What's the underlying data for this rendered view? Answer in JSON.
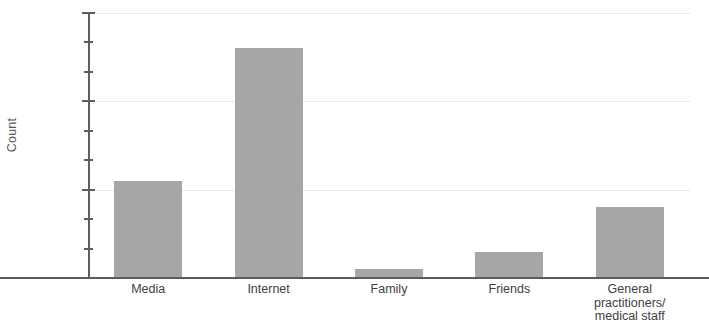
{
  "chart_data": {
    "type": "bar",
    "title": "",
    "subtitle": "",
    "xlabel": "",
    "ylabel": "Count",
    "categories": [
      "Media",
      "Internet",
      "Family",
      "Friends",
      "General practitioners/ medical staff"
    ],
    "category_lines": [
      [
        "Media"
      ],
      [
        "Internet"
      ],
      [
        "Family"
      ],
      [
        "Friends"
      ],
      [
        "General",
        "practitioners/",
        "medical staff"
      ]
    ],
    "values": [
      11,
      26,
      1,
      3,
      8
    ],
    "ylim": [
      0,
      30
    ],
    "ytick_labels": [
      "0",
      "10",
      "20",
      "30"
    ],
    "ytick_values": [
      0,
      10,
      20,
      30
    ],
    "yminor_tick_values": [
      3.333,
      6.667,
      13.333,
      16.667,
      23.333,
      26.667
    ],
    "grid": true,
    "grid_axis": "y",
    "legend": "none",
    "bar_color": "#a6a6a6",
    "axis_color": "#5d5e60",
    "text_color": "#414042",
    "grid_color": "#e9e9e7"
  }
}
